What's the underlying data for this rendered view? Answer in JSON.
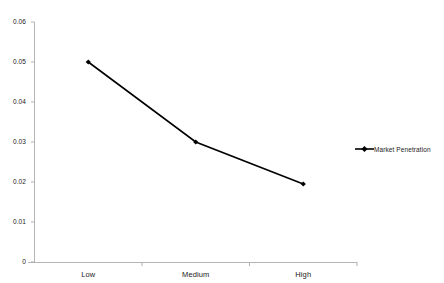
{
  "chart_data": {
    "type": "line",
    "title": "",
    "subtitle": "",
    "xlabel": "",
    "ylabel": "",
    "categories": [
      "Low",
      "Medium",
      "High"
    ],
    "series": [
      {
        "name": "Market Penetration",
        "values": [
          0.05,
          0.03,
          0.0195
        ],
        "color": "#000000",
        "marker": "diamond"
      }
    ],
    "ylim": [
      0,
      0.06
    ],
    "y_ticks": [
      "0",
      "0.01",
      "0.02",
      "0.03",
      "0.04",
      "0.05",
      "0.06"
    ],
    "y_tick_values": [
      0,
      0.01,
      0.02,
      0.03,
      0.04,
      0.05,
      0.06
    ],
    "grid": false,
    "legend_position": "right",
    "axis_color": "#b0b0b0",
    "background": "#ffffff"
  },
  "legend": {
    "entries": [
      {
        "label": "Market Penetration",
        "marker": "line-diamond-marker",
        "color": "#000000"
      }
    ]
  }
}
